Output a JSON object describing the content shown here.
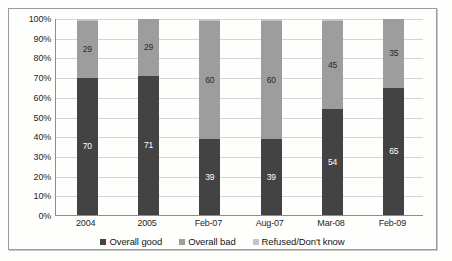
{
  "chart_data": {
    "type": "bar",
    "subtype": "100% stacked column",
    "title": "",
    "xlabel": "",
    "ylabel": "",
    "categories": [
      "2004",
      "2005",
      "Feb-07",
      "Aug-07",
      "Mar-08",
      "Feb-09"
    ],
    "series": [
      {
        "name": "Overall good",
        "color": "#434343",
        "values": [
          70,
          71,
          39,
          39,
          54,
          65
        ]
      },
      {
        "name": "Overall bad",
        "color": "#9d9d9d",
        "values": [
          29,
          29,
          60,
          60,
          45,
          35
        ]
      },
      {
        "name": "Refused/Don't know",
        "color": "#c4c4c4",
        "values": [
          1,
          0,
          1,
          1,
          1,
          0
        ]
      }
    ],
    "ylim": [
      0,
      100
    ],
    "yticks": [
      "0%",
      "10%",
      "20%",
      "30%",
      "40%",
      "50%",
      "60%",
      "70%",
      "80%",
      "90%",
      "100%"
    ],
    "ytick_values": [
      0,
      10,
      20,
      30,
      40,
      50,
      60,
      70,
      80,
      90,
      100
    ],
    "grid": true,
    "legend_position": "bottom",
    "data_labels_shown": [
      "Overall good",
      "Overall bad"
    ]
  },
  "legend": {
    "items": [
      {
        "label": "Overall good",
        "color": "#434343"
      },
      {
        "label": "Overall bad",
        "color": "#9d9d9d"
      },
      {
        "label": "Refused/Don't know",
        "color": "#c4c4c4"
      }
    ]
  }
}
